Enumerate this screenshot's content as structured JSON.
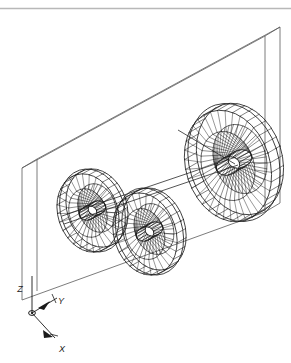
{
  "viewport": {
    "name": "cad-3d-wireframe-viewport",
    "width": 291,
    "height": 363,
    "background_color": "#ffffff",
    "line_color": "#1a1a1a",
    "enclosure_line_color": "#4a4a4a",
    "top_rule_color": "#b4b4b4",
    "projection": "isometric",
    "render_mode": "wireframe"
  },
  "top_rule": {
    "label": "",
    "y": 8,
    "color": "#b8b8b8"
  },
  "axis_triad": {
    "name": "ucs-axis-triad",
    "origin_screen": [
      32,
      313
    ],
    "axes": [
      {
        "id": "z",
        "label": "Z",
        "label_pos": [
          20,
          288
        ],
        "direction": "up",
        "tip": [
          32,
          275
        ]
      },
      {
        "id": "y",
        "label": "Y",
        "label_pos": [
          59,
          302
        ],
        "direction": "up-right",
        "tip": [
          53,
          296
        ]
      },
      {
        "id": "x",
        "label": "X",
        "label_pos": [
          59,
          349
        ],
        "direction": "down-right",
        "tip": [
          48,
          334
        ]
      }
    ]
  },
  "enclosure": {
    "name": "bounding-slab",
    "description": "thin rectangular panel volume",
    "front_face": [
      [
        22,
        168
      ],
      [
        265,
        36
      ],
      [
        265,
        212
      ],
      [
        22,
        300
      ]
    ],
    "depth_offset": [
      15,
      -9
    ]
  },
  "wheels": [
    {
      "id": "wheel-1",
      "name": "spoked-wheel-left",
      "center": [
        88,
        213
      ],
      "rx": 30,
      "ry": 40,
      "rim_tilt_deg": -18,
      "spoke_count": 28,
      "hub_rx": 9,
      "hub_ry": 7,
      "rim_depth": [
        9,
        -5
      ],
      "inner_ratio": 0.62
    },
    {
      "id": "wheel-2",
      "name": "spoked-wheel-middle",
      "center": [
        145,
        234
      ],
      "rx": 31,
      "ry": 42,
      "rim_tilt_deg": -18,
      "spoke_count": 28,
      "hub_rx": 9,
      "hub_ry": 7,
      "rim_depth": [
        9,
        -5
      ],
      "inner_ratio": 0.62
    },
    {
      "id": "wheel-3",
      "name": "spoked-wheel-right-large",
      "center": [
        228,
        166
      ],
      "rx": 42,
      "ry": 57,
      "rim_tilt_deg": -18,
      "spoke_count": 36,
      "hub_rx": 12,
      "hub_ry": 9,
      "rim_depth": [
        12,
        -7
      ],
      "inner_ratio": 0.62
    }
  ],
  "axle": {
    "name": "axle-shaft",
    "from": [
      70,
      221
    ],
    "to": [
      240,
      161
    ],
    "extension_from": [
      180,
      131
    ],
    "extension_to": [
      232,
      163
    ]
  }
}
